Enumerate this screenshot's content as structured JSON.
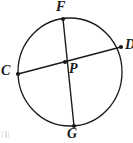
{
  "figure": {
    "type": "circle-geometry-diagram",
    "canvas": {
      "width": 133,
      "height": 143
    },
    "background_color": "#ffffff",
    "stroke_color": "#1a1a1a",
    "label_color": "#1a1a1a",
    "circle": {
      "center_x": 70,
      "center_y": 72,
      "radius_x": 52,
      "radius_y": 54,
      "stroke_width": 1.3
    },
    "points": {
      "F": {
        "label": "F",
        "x": 63,
        "y": 19
      },
      "G": {
        "label": "G",
        "x": 74,
        "y": 126
      },
      "C": {
        "label": "C",
        "x": 18,
        "y": 74
      },
      "D": {
        "label": "D",
        "x": 121,
        "y": 47
      },
      "P": {
        "label": "P",
        "x": 65,
        "y": 62
      }
    },
    "segments": [
      {
        "name": "diameter-FG",
        "from": "F",
        "to": "G",
        "stroke_width": 1.4
      },
      {
        "name": "chord-CD",
        "from": "C",
        "to": "D",
        "stroke_width": 1.4
      }
    ],
    "labels": {
      "F": "F",
      "C": "C",
      "D": "D",
      "G": "G",
      "P": "P"
    }
  }
}
